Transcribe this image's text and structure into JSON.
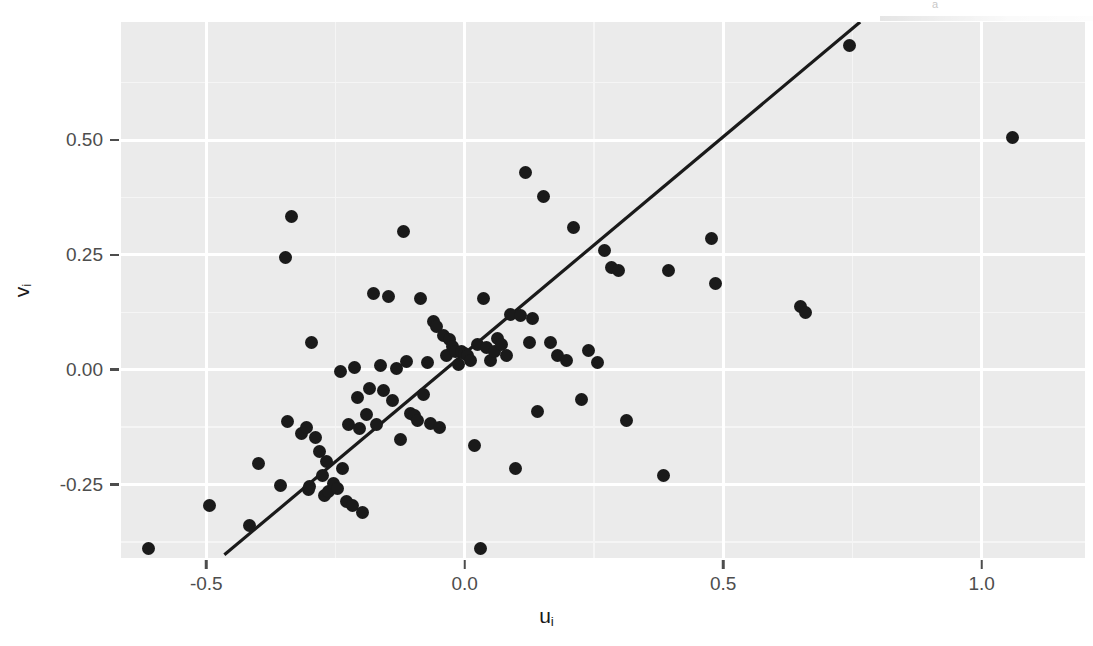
{
  "figure": {
    "background": "#ffffff",
    "panel_background": "#ebebeb",
    "gridline_color": "#ffffff",
    "point_color": "#1a1a1a",
    "line_color": "#1a1a1a",
    "scan_artifact_text": "a"
  },
  "chart_data": {
    "type": "scatter",
    "title": "",
    "xlabel": "u",
    "xlabel_sub": "i",
    "ylabel": "v",
    "ylabel_sub": "i",
    "xlabel_full": "u_i",
    "ylabel_full": "v_i",
    "grid": true,
    "legend": "none",
    "xlim": [
      -0.665,
      1.2
    ],
    "ylim": [
      -0.41,
      0.757
    ],
    "xticks": [
      -0.5,
      0.0,
      0.5,
      1.0
    ],
    "xtick_labels": [
      "-0.5",
      "0.0",
      "0.5",
      "1.0"
    ],
    "yticks": [
      -0.25,
      0.0,
      0.25,
      0.5
    ],
    "ytick_labels": [
      "-0.25",
      "0.00",
      "0.25",
      "0.50"
    ],
    "x_minor_ticks": [
      -0.25,
      0.25,
      0.75
    ],
    "y_minor_ticks": [
      -0.375,
      -0.125,
      0.125,
      0.375,
      0.625
    ],
    "fit_line": {
      "type": "linear",
      "x_start": -0.465,
      "y_start": -0.403,
      "x_end": 0.765,
      "y_end": 0.757,
      "slope": 0.943,
      "intercept": 0.035
    },
    "n_points": 97,
    "x": [
      -0.612,
      -0.494,
      -0.417,
      -0.399,
      -0.356,
      -0.347,
      -0.342,
      -0.336,
      -0.316,
      -0.307,
      -0.303,
      -0.3,
      -0.296,
      -0.289,
      -0.281,
      -0.276,
      -0.272,
      -0.268,
      -0.263,
      -0.253,
      -0.247,
      -0.241,
      -0.236,
      -0.228,
      -0.224,
      -0.218,
      -0.213,
      -0.207,
      -0.203,
      -0.197,
      -0.19,
      -0.184,
      -0.176,
      -0.171,
      -0.163,
      -0.157,
      -0.148,
      -0.139,
      -0.132,
      -0.124,
      -0.118,
      -0.112,
      -0.105,
      -0.098,
      -0.092,
      -0.086,
      -0.079,
      -0.072,
      -0.066,
      -0.06,
      -0.054,
      -0.048,
      -0.042,
      -0.036,
      -0.03,
      -0.024,
      -0.018,
      -0.012,
      -0.006,
      0.0,
      0.006,
      0.012,
      0.018,
      0.024,
      0.03,
      0.036,
      0.043,
      0.05,
      0.057,
      0.064,
      0.072,
      0.08,
      0.089,
      0.098,
      0.108,
      0.118,
      0.125,
      0.131,
      0.14,
      0.152,
      0.166,
      0.18,
      0.196,
      0.21,
      0.225,
      0.24,
      0.256,
      0.27,
      0.283,
      0.297,
      0.312,
      0.385,
      0.395,
      0.478,
      0.485,
      0.65,
      0.66,
      0.745,
      1.06
    ],
    "y": [
      -0.39,
      -0.295,
      -0.34,
      -0.205,
      -0.252,
      0.244,
      -0.112,
      0.333,
      -0.138,
      -0.125,
      -0.26,
      -0.255,
      0.06,
      -0.148,
      -0.178,
      -0.23,
      -0.273,
      -0.2,
      -0.265,
      -0.247,
      -0.258,
      -0.004,
      -0.215,
      -0.288,
      -0.12,
      -0.295,
      0.004,
      -0.06,
      -0.128,
      -0.31,
      -0.098,
      -0.04,
      0.166,
      -0.12,
      0.01,
      -0.045,
      0.16,
      -0.068,
      0.003,
      -0.152,
      0.3,
      0.018,
      -0.095,
      -0.1,
      -0.11,
      0.155,
      -0.055,
      0.016,
      -0.118,
      0.105,
      0.095,
      -0.125,
      0.075,
      0.03,
      0.065,
      0.05,
      0.04,
      0.012,
      0.04,
      0.035,
      0.03,
      0.02,
      -0.165,
      0.055,
      -0.39,
      0.155,
      0.048,
      0.02,
      0.04,
      0.068,
      0.055,
      0.03,
      0.12,
      -0.215,
      0.118,
      0.43,
      0.06,
      0.112,
      -0.09,
      0.378,
      0.06,
      0.03,
      0.02,
      0.31,
      -0.065,
      0.042,
      0.015,
      0.26,
      0.222,
      0.215,
      -0.11,
      -0.23,
      0.215,
      0.285,
      0.188,
      0.138,
      0.125,
      0.705,
      0.505,
      0.312,
      0.128,
      0.475,
      0.24
    ]
  },
  "axes": {
    "y_ticks": [
      {
        "label": "0.50",
        "value": 0.5
      },
      {
        "label": "0.25",
        "value": 0.25
      },
      {
        "label": "0.00",
        "value": 0.0
      },
      {
        "label": "-0.25",
        "value": -0.25
      }
    ],
    "x_ticks": [
      {
        "label": "-0.5",
        "value": -0.5
      },
      {
        "label": "0.0",
        "value": 0.0
      },
      {
        "label": "0.5",
        "value": 0.5
      },
      {
        "label": "1.0",
        "value": 1.0
      }
    ]
  }
}
